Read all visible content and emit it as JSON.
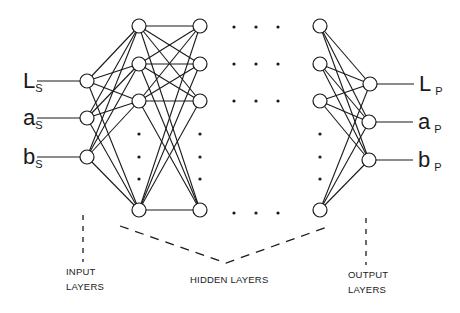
{
  "diagram": {
    "colors": {
      "line": "#1a1a1a",
      "node_fill": "#ffffff",
      "background": "#ffffff"
    },
    "node_radius": 7,
    "inputs": [
      {
        "main": "L",
        "sub": "S",
        "x": 87,
        "y": 81
      },
      {
        "main": "a",
        "sub": "S",
        "x": 87,
        "y": 118
      },
      {
        "main": "b",
        "sub": "S",
        "x": 87,
        "y": 157
      }
    ],
    "hidden_layers": [
      {
        "x": 139,
        "ys": [
          26,
          64,
          101,
          210
        ]
      },
      {
        "x": 200,
        "ys": [
          26,
          64,
          101,
          210
        ]
      },
      {
        "x": 320,
        "ys": [
          26,
          64,
          101,
          210
        ]
      }
    ],
    "outputs": [
      {
        "main": "L",
        "sub": "P",
        "x": 370,
        "y": 84
      },
      {
        "main": "a",
        "sub": "P",
        "x": 369,
        "y": 122
      },
      {
        "main": "b",
        "sub": "P",
        "x": 369,
        "y": 160
      }
    ],
    "ellipsis_rows_y": [
      27,
      64,
      101,
      213
    ],
    "ellipsis_cols_x": [
      234,
      256,
      278
    ],
    "vertical_ellipsis_y": [
      134,
      157,
      179
    ],
    "captions": {
      "input": [
        "INPUT",
        "LAYERS"
      ],
      "hidden": "HIDDEN LAYERS",
      "output": [
        "OUTPUT",
        "LAYERS"
      ]
    }
  }
}
